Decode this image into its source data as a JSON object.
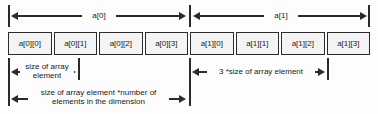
{
  "diagram": {
    "top_dimensions": [
      {
        "label": "a[0]"
      },
      {
        "label": "a[1]"
      }
    ],
    "cells": [
      {
        "label": "a[0][0]"
      },
      {
        "label": "a[0][1]"
      },
      {
        "label": "a[0][2]"
      },
      {
        "label": "a[0][3]"
      },
      {
        "label": "a[1][0]"
      },
      {
        "label": "a[1][1]"
      },
      {
        "label": "a[1][2]"
      },
      {
        "label": "a[1][3]"
      }
    ],
    "bottom_measures": [
      {
        "label": "size of array element"
      },
      {
        "label": "3 *size of array element"
      },
      {
        "label": "size of array element *number of elements in the dimension"
      }
    ],
    "colors": {
      "line": "#2b2b2b",
      "cell_fill": "#f4f4f4",
      "background": "#fdfdfd",
      "text": "#1a1a1a"
    }
  }
}
